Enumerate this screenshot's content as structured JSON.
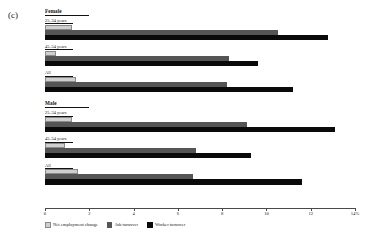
{
  "panel": {
    "label": "(c)"
  },
  "chart_data": {
    "type": "bar",
    "orientation": "horizontal",
    "title": "",
    "subtitle": "",
    "xlabel": "",
    "ylabel": "",
    "xlim": [
      0,
      14
    ],
    "grid": false,
    "legend_position": "bottom-left",
    "axis_ticks": [
      "0",
      "2",
      "4",
      "6",
      "8",
      "10",
      "12",
      "14%"
    ],
    "axis_tick_values": [
      0,
      2,
      4,
      6,
      8,
      10,
      12,
      14
    ],
    "series": [
      {
        "name": "Net employment change",
        "color": "#cfcfcf"
      },
      {
        "name": "Job turnover",
        "color": "#555555"
      },
      {
        "name": "Worker turnover",
        "color": "#0a0a0a"
      }
    ],
    "groups": [
      {
        "name": "Female",
        "categories": [
          {
            "label": "25–34 years",
            "values": [
              1.2,
              10.5,
              12.8
            ]
          },
          {
            "label": "45–54 years",
            "values": [
              0.5,
              8.3,
              9.6
            ]
          },
          {
            "label": "All",
            "values": [
              1.4,
              8.2,
              11.2
            ]
          }
        ]
      },
      {
        "name": "Male",
        "categories": [
          {
            "label": "25–34 years",
            "values": [
              1.2,
              9.1,
              13.1
            ]
          },
          {
            "label": "45–54 years",
            "values": [
              0.9,
              6.8,
              9.3
            ]
          },
          {
            "label": "All",
            "values": [
              1.5,
              6.7,
              11.6
            ]
          }
        ]
      }
    ]
  }
}
